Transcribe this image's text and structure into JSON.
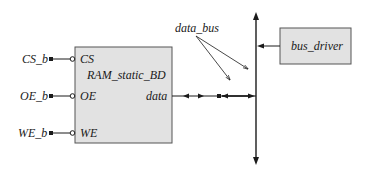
{
  "diagram": {
    "type": "block-diagram",
    "colors": {
      "line": "#1a1a1a",
      "box_fill": "#e2e2e2",
      "box_stroke": "#555555",
      "background": "#ffffff"
    },
    "ram_block": {
      "name": "RAM_static_BD",
      "ports": [
        {
          "external_signal": "CS_b",
          "pin": "CS",
          "active_low": true
        },
        {
          "external_signal": "OE_b",
          "pin": "OE",
          "active_low": true
        },
        {
          "external_signal": "WE_b",
          "pin": "WE",
          "active_low": true
        }
      ],
      "data_port": "data"
    },
    "bus_driver": {
      "name": "bus_driver"
    },
    "bus_label": "data_bus"
  }
}
